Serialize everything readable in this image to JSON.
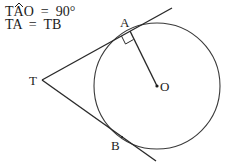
{
  "caption": {
    "line1_prefix": "T",
    "line1_hat": "A",
    "line1_suffix": "O  =  90°",
    "line2": "TA  =  TB"
  },
  "points": {
    "T": {
      "label": "T",
      "x": 42,
      "y": 80
    },
    "A": {
      "label": "A",
      "x": 130,
      "y": 31
    },
    "B": {
      "label": "B",
      "x": 122,
      "y": 137
    },
    "O": {
      "label": "O",
      "x": 157,
      "y": 86
    }
  },
  "circle": {
    "cx": 157,
    "cy": 86,
    "r": 63
  },
  "colors": {
    "stroke": "#2a2a2a",
    "text": "#1c1c1c",
    "background": "#ffffff"
  }
}
